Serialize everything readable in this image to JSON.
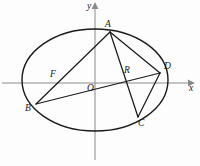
{
  "figure": {
    "axes": {
      "x_label": "x",
      "y_label": "y",
      "origin_label": "O",
      "x_axis_y": 83,
      "y_axis_x": 95
    },
    "conic": {
      "type": "ellipse",
      "center_x": 95,
      "center_y": 80,
      "semi_major_a": 73,
      "semi_minor_b": 51,
      "stroke": "#1a1a1a"
    },
    "points": [
      {
        "id": "A",
        "label": "A",
        "x": 110,
        "y": 32,
        "label_x": 105,
        "label_y": 20
      },
      {
        "id": "B",
        "label": "B",
        "x": 36,
        "y": 104,
        "label_x": 25,
        "label_y": 104
      },
      {
        "id": "C",
        "label": "C",
        "x": 138,
        "y": 117,
        "label_x": 138,
        "label_y": 119
      },
      {
        "id": "D",
        "label": "D",
        "x": 160,
        "y": 73,
        "label_x": 164,
        "label_y": 62
      },
      {
        "id": "F",
        "label": "F",
        "x": 56,
        "y": 84,
        "label_x": 50,
        "label_y": 70
      },
      {
        "id": "R",
        "label": "R",
        "x": 127,
        "y": 78,
        "label_x": 124,
        "label_y": 66
      },
      {
        "id": "O",
        "label": "O",
        "x": 95,
        "y": 83,
        "label_x": 87,
        "label_y": 84
      }
    ],
    "segments": [
      {
        "name": "segment-AB",
        "from": "A",
        "to": "B"
      },
      {
        "name": "segment-AC",
        "from": "A",
        "to": "C"
      },
      {
        "name": "segment-AD",
        "from": "A",
        "to": "D"
      },
      {
        "name": "segment-BD",
        "from": "B",
        "to": "D"
      },
      {
        "name": "segment-CD",
        "from": "C",
        "to": "D"
      }
    ]
  }
}
